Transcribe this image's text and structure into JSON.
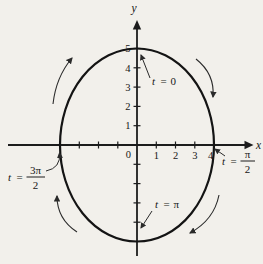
{
  "colors": {
    "paper": "#f2f0eb",
    "ink": "#1c1c1c"
  },
  "axes": {
    "x_label": "x",
    "y_label": "y",
    "origin_label": "0",
    "x_tick_labels": [
      "1",
      "2",
      "3",
      "4"
    ],
    "y_tick_labels": [
      "1",
      "2",
      "3",
      "4",
      "5"
    ],
    "unlabeled_negative_x_ticks": 3,
    "unlabeled_negative_y_ticks": 4
  },
  "parameter_labels": {
    "t0": {
      "var": "t",
      "eq": "=",
      "value": "0"
    },
    "tpi2": {
      "var": "t",
      "eq": "=",
      "numerator": "π",
      "denominator": "2"
    },
    "tpi": {
      "var": "t",
      "eq": "=",
      "value": "π"
    },
    "t3pi2": {
      "var": "t",
      "eq": "=",
      "numerator": "3π",
      "denominator": "2"
    }
  },
  "curve": {
    "type": "parametric-ellipse",
    "semi_axis_x_units": 4,
    "semi_axis_y_units": 5,
    "direction": "clockwise",
    "key_points": [
      {
        "t": "0",
        "x": 0,
        "y": 5
      },
      {
        "t": "π/2",
        "x": 4,
        "y": 0
      },
      {
        "t": "π",
        "x": 0,
        "y": -5
      },
      {
        "t": "3π/2",
        "x": -4,
        "y": 0
      }
    ]
  }
}
